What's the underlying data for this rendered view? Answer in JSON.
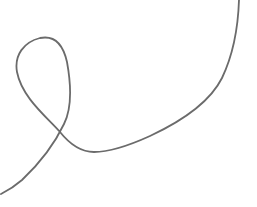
{
  "canvas": {
    "width": 257,
    "height": 207,
    "background": "#ffffff"
  },
  "stroke": {
    "color": "#6b6b6b",
    "width": 1.8,
    "path": "M 239 0 C 238 30, 233 55, 222 78 C 210 102, 180 122, 150 136 C 128 146, 110 152, 94 152 C 80 152, 68 142, 60 132 C 48 118, 22 98, 17 72 C 14 55, 24 42, 40 38 C 55 35, 63 44, 67 62 C 71 84, 72 108, 64 124 C 55 143, 40 163, 22 180 C 14 187, 7 191, 1 194"
  }
}
